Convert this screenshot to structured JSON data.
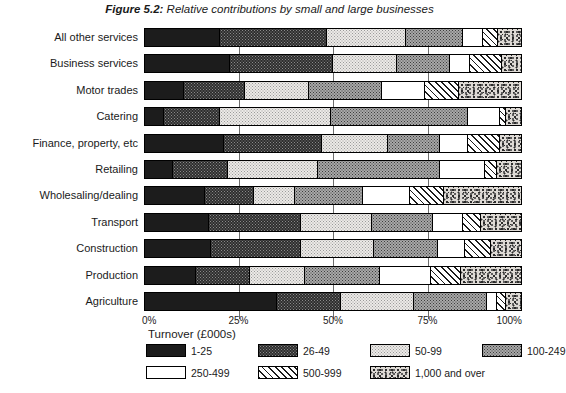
{
  "title": {
    "prefix": "Figure 5.2:",
    "text": " Relative contributions by small and large businesses"
  },
  "axis": {
    "x_title": "Turnover (£000s)",
    "ticks": [
      "0%",
      "25%",
      "50%",
      "75%",
      "100%"
    ],
    "tick_values": [
      0,
      25,
      50,
      75,
      100
    ]
  },
  "legend": {
    "title": "Turnover (£000s)",
    "items": [
      {
        "label": "1-25",
        "pattern": "solid-black"
      },
      {
        "label": "26-49",
        "pattern": "dark-dotted"
      },
      {
        "label": "50-99",
        "pattern": "light-dotted"
      },
      {
        "label": "100-249",
        "pattern": "grey-checker"
      },
      {
        "label": "250-499",
        "pattern": "white"
      },
      {
        "label": "500-999",
        "pattern": "diagonal-hatch"
      },
      {
        "label": "1,000 and over",
        "pattern": "speckled"
      }
    ]
  },
  "chart_data": {
    "type": "bar",
    "orientation": "horizontal",
    "stacked": true,
    "normalized": true,
    "title": "Figure 5.2: Relative contributions by small and large businesses",
    "xlabel": "Turnover (£000s)",
    "ylabel": "",
    "xlim": [
      0,
      100
    ],
    "grid": true,
    "legend_position": "bottom",
    "series_names": [
      "1-25",
      "26-49",
      "50-99",
      "100-249",
      "250-499",
      "500-999",
      "1,000 and over"
    ],
    "categories": [
      "All other services",
      "Business services",
      "Motor trades",
      "Catering",
      "Finance, property, etc",
      "Retailing",
      "Wholesaling/dealing",
      "Transport",
      "Construction",
      "Production",
      "Agriculture"
    ],
    "values": [
      [
        20.0,
        28.5,
        21.0,
        15.0,
        5.5,
        4.0,
        6.0
      ],
      [
        22.5,
        27.5,
        17.0,
        14.0,
        5.5,
        8.5,
        5.0
      ],
      [
        10.5,
        16.0,
        17.0,
        19.5,
        11.5,
        9.0,
        16.5
      ],
      [
        5.0,
        15.0,
        29.5,
        36.5,
        8.5,
        1.5,
        4.0
      ],
      [
        21.0,
        26.0,
        17.5,
        14.0,
        7.5,
        8.5,
        5.5
      ],
      [
        7.5,
        14.5,
        24.0,
        32.5,
        12.0,
        3.0,
        6.5
      ],
      [
        16.0,
        13.0,
        11.0,
        18.0,
        12.5,
        9.0,
        20.5
      ],
      [
        17.0,
        24.5,
        19.0,
        16.0,
        8.0,
        5.0,
        10.5
      ],
      [
        17.5,
        24.0,
        19.5,
        17.0,
        7.0,
        7.0,
        8.0
      ],
      [
        13.5,
        14.5,
        14.5,
        20.0,
        13.5,
        8.0,
        16.0
      ],
      [
        35.0,
        17.0,
        19.5,
        19.5,
        2.5,
        2.5,
        4.0
      ]
    ]
  },
  "rows": [
    {
      "label": "All other services",
      "segments": [
        20.0,
        28.5,
        21.0,
        15.0,
        5.5,
        4.0,
        6.0
      ]
    },
    {
      "label": "Business services",
      "segments": [
        22.5,
        27.5,
        17.0,
        14.0,
        5.5,
        8.5,
        5.0
      ]
    },
    {
      "label": "Motor trades",
      "segments": [
        10.5,
        16.0,
        17.0,
        19.5,
        11.5,
        9.0,
        16.5
      ]
    },
    {
      "label": "Catering",
      "segments": [
        5.0,
        15.0,
        29.5,
        36.5,
        8.5,
        1.5,
        4.0
      ]
    },
    {
      "label": "Finance, property, etc",
      "segments": [
        21.0,
        26.0,
        17.5,
        14.0,
        7.5,
        8.5,
        5.5
      ]
    },
    {
      "label": "Retailing",
      "segments": [
        7.5,
        14.5,
        24.0,
        32.5,
        12.0,
        3.0,
        6.5
      ]
    },
    {
      "label": "Wholesaling/dealing",
      "segments": [
        16.0,
        13.0,
        11.0,
        18.0,
        12.5,
        9.0,
        20.5
      ]
    },
    {
      "label": "Transport",
      "segments": [
        17.0,
        24.5,
        19.0,
        16.0,
        8.0,
        5.0,
        10.5
      ]
    },
    {
      "label": "Construction",
      "segments": [
        17.5,
        24.0,
        19.5,
        17.0,
        7.0,
        7.0,
        8.0
      ]
    },
    {
      "label": "Production",
      "segments": [
        13.5,
        14.5,
        14.5,
        20.0,
        13.5,
        8.0,
        16.0
      ]
    },
    {
      "label": "Agriculture",
      "segments": [
        35.0,
        17.0,
        19.5,
        19.5,
        2.5,
        2.5,
        4.0
      ]
    }
  ]
}
